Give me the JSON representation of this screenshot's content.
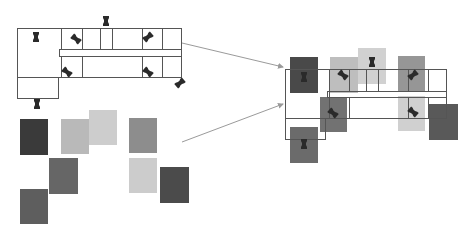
{
  "diagram": {
    "colors": {
      "wall": "#555555",
      "arrow": "#9a9a9a",
      "camera": "#2a2a2a"
    },
    "left_plan": {
      "cameras": [
        {
          "x": 36,
          "y": 37,
          "rot": 0
        },
        {
          "x": 76,
          "y": 39,
          "rot": -50
        },
        {
          "x": 106,
          "y": 21,
          "rot": 0
        },
        {
          "x": 148,
          "y": 37,
          "rot": 50
        },
        {
          "x": 67,
          "y": 72,
          "rot": -50
        },
        {
          "x": 148,
          "y": 72,
          "rot": -50
        },
        {
          "x": 180,
          "y": 83,
          "rot": 50
        },
        {
          "x": 37,
          "y": 104,
          "rot": 0
        }
      ]
    },
    "swatches": [
      {
        "id": "A",
        "x": 20,
        "y": 119,
        "w": 28,
        "h": 36,
        "color": "#3a3a3a"
      },
      {
        "id": "B",
        "x": 61,
        "y": 119,
        "w": 28,
        "h": 35,
        "color": "#b9b9b9"
      },
      {
        "id": "C",
        "x": 89,
        "y": 110,
        "w": 28,
        "h": 35,
        "color": "#cdcdcd"
      },
      {
        "id": "D",
        "x": 49,
        "y": 158,
        "w": 29,
        "h": 36,
        "color": "#666666"
      },
      {
        "id": "E",
        "x": 20,
        "y": 189,
        "w": 28,
        "h": 35,
        "color": "#5e5e5e"
      },
      {
        "id": "F",
        "x": 129,
        "y": 118,
        "w": 28,
        "h": 35,
        "color": "#8d8d8d"
      },
      {
        "id": "G",
        "x": 129,
        "y": 158,
        "w": 28,
        "h": 35,
        "color": "#cccccc"
      },
      {
        "id": "H",
        "x": 160,
        "y": 167,
        "w": 29,
        "h": 36,
        "color": "#4b4b4b"
      }
    ],
    "right_plan": {
      "tiles": [
        {
          "id": "A",
          "x": 290,
          "y": 57,
          "w": 28,
          "h": 36,
          "color": "#3a3a3a"
        },
        {
          "id": "B",
          "x": 330,
          "y": 57,
          "w": 28,
          "h": 36,
          "color": "#b9b9b9"
        },
        {
          "id": "C",
          "x": 358,
          "y": 48,
          "w": 28,
          "h": 36,
          "color": "#cdcdcd"
        },
        {
          "id": "F",
          "x": 398,
          "y": 56,
          "w": 27,
          "h": 36,
          "color": "#8d8d8d"
        },
        {
          "id": "D",
          "x": 320,
          "y": 97,
          "w": 27,
          "h": 35,
          "color": "#666666"
        },
        {
          "id": "G",
          "x": 398,
          "y": 96,
          "w": 27,
          "h": 35,
          "color": "#cccccc"
        },
        {
          "id": "H",
          "x": 429,
          "y": 104,
          "w": 29,
          "h": 36,
          "color": "#4b4b4b"
        },
        {
          "id": "E",
          "x": 290,
          "y": 127,
          "w": 28,
          "h": 36,
          "color": "#5e5e5e"
        }
      ],
      "cameras": [
        {
          "x": 304,
          "y": 77,
          "rot": 0
        },
        {
          "x": 343,
          "y": 75,
          "rot": -50
        },
        {
          "x": 372,
          "y": 62,
          "rot": 0
        },
        {
          "x": 413,
          "y": 75,
          "rot": 50
        },
        {
          "x": 333,
          "y": 113,
          "rot": -50
        },
        {
          "x": 413,
          "y": 112,
          "rot": -50
        },
        {
          "x": 304,
          "y": 144,
          "rot": 0
        }
      ]
    },
    "arrows": [
      {
        "x1": 182,
        "y1": 43,
        "x2": 283,
        "y2": 67
      },
      {
        "x1": 182,
        "y1": 142,
        "x2": 283,
        "y2": 104
      }
    ]
  }
}
